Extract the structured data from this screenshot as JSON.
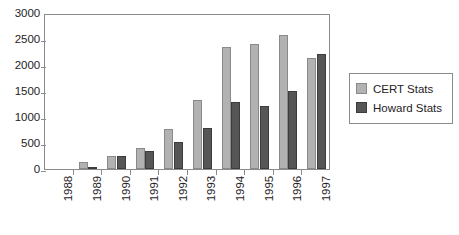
{
  "chart_data": {
    "type": "bar",
    "title": "",
    "xlabel": "",
    "ylabel": "",
    "categories": [
      "1988",
      "1989",
      "1990",
      "1991",
      "1992",
      "1993",
      "1994",
      "1995",
      "1996",
      "1997"
    ],
    "series": [
      {
        "name": "CERT Stats",
        "color": "#b2b2b2",
        "values": [
          0,
          132,
          252,
          406,
          773,
          1334,
          2340,
          2412,
          2573,
          2134
        ]
      },
      {
        "name": "Howard Stats",
        "color": "#565656",
        "values": [
          0,
          25,
          252,
          345,
          510,
          790,
          1280,
          1220,
          1500,
          2205
        ]
      }
    ],
    "ylim": [
      0,
      3000
    ],
    "yticks": [
      0,
      500,
      1000,
      1500,
      2000,
      2500,
      3000
    ],
    "ytick_labels": [
      "0",
      "500",
      "1000",
      "1500",
      "2000",
      "2500",
      "3000"
    ],
    "grid": false,
    "legend_position": "right",
    "xtick_rotation": 90
  },
  "legend": {
    "entries": [
      {
        "label": "CERT Stats"
      },
      {
        "label": "Howard Stats"
      }
    ]
  }
}
